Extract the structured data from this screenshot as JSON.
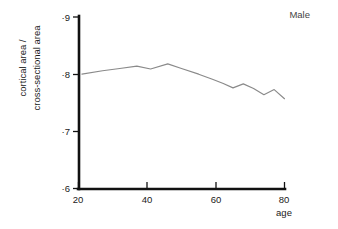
{
  "chart_data": {
    "type": "line",
    "title": "",
    "series_label": "Male",
    "xlabel": "age",
    "ylabel_line1": "cortical area /",
    "ylabel_line2": "cross-sectional area",
    "xlim": [
      20,
      80
    ],
    "ylim": [
      0.6,
      0.9
    ],
    "xticks": [
      20,
      40,
      60,
      80
    ],
    "xtick_labels": [
      "20",
      "40",
      "60",
      "80"
    ],
    "yticks": [
      0.6,
      0.7,
      0.8,
      0.9
    ],
    "ytick_labels": [
      "·6",
      "·7",
      "·8",
      "·9"
    ],
    "grid": false,
    "legend_position": "top-right",
    "series": [
      {
        "name": "Male",
        "color": "#8a8a8a",
        "x": [
          21,
          27,
          32,
          37,
          41,
          46,
          50,
          55,
          59,
          62,
          65,
          68,
          71,
          74,
          77,
          80
        ],
        "y": [
          0.8,
          0.806,
          0.81,
          0.814,
          0.809,
          0.818,
          0.81,
          0.8,
          0.791,
          0.784,
          0.776,
          0.783,
          0.775,
          0.764,
          0.773,
          0.757
        ]
      }
    ]
  }
}
